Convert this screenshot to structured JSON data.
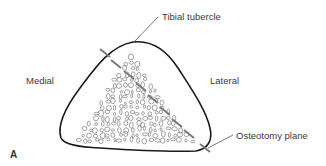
{
  "diagram": {
    "panel_label": "A",
    "labels": {
      "tibial_tubercle": "Tibial tubercle",
      "medial": "Medial",
      "lateral": "Lateral",
      "osteotomy_plane": "Osteotomy plane"
    },
    "colors": {
      "outline": "#1a1a1a",
      "pores": "#8a8a8a",
      "osteotomy_line": "#7a7a7a",
      "text": "#3a3a3a"
    }
  }
}
